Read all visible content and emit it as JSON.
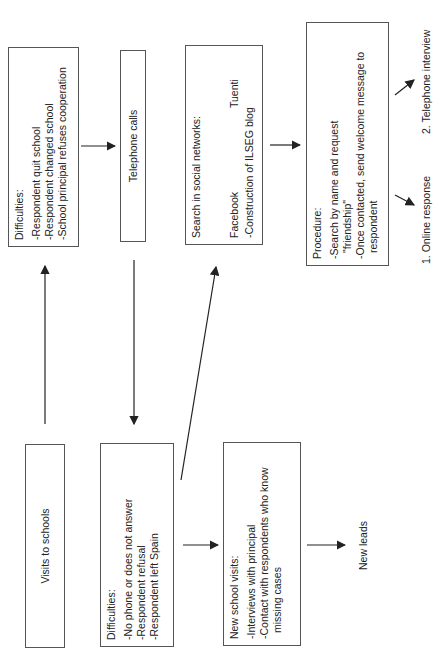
{
  "diagram": {
    "orientation": "rotated-90-ccw",
    "nodes": {
      "visits_to_schools": {
        "label": "Visits to schools"
      },
      "difficulties_schools": {
        "title": "Difficulties:",
        "items": [
          "-Respondent quit school",
          "-Respondent changed school",
          "-School principal refuses cooperation"
        ]
      },
      "telephone_calls": {
        "label": "Telephone calls"
      },
      "difficulties_phone": {
        "title": "Difficulties:",
        "items": [
          "-No phone or does not answer",
          "-Respondent refusal",
          "-Respondent left Spain"
        ]
      },
      "social_networks": {
        "title": "Search in social networks:",
        "facebook": "Facebook",
        "tuenti": "Tuenti",
        "blog": "-Construction of ILSEG blog"
      },
      "new_school_visits": {
        "title": "New school visits:",
        "items": [
          "-Interviews with principal",
          "-Contact with respondents who know",
          "missing cases"
        ]
      },
      "new_leads": {
        "label": "New leads"
      },
      "procedure": {
        "title": "Procedure:",
        "items": [
          "-Search by name and request",
          "\"friendship\"",
          "-Once contacted, send welcome message to",
          "respondent"
        ]
      },
      "online_response": {
        "label": "1. Online response"
      },
      "telephone_interview": {
        "label": "2. Telephone interview"
      }
    },
    "edges": [
      {
        "from": "visits_to_schools",
        "to": "difficulties_schools"
      },
      {
        "from": "difficulties_schools",
        "to": "telephone_calls"
      },
      {
        "from": "telephone_calls",
        "to": "difficulties_phone"
      },
      {
        "from": "difficulties_phone",
        "to": "social_networks"
      },
      {
        "from": "difficulties_phone",
        "to": "new_school_visits"
      },
      {
        "from": "new_school_visits",
        "to": "new_leads"
      },
      {
        "from": "social_networks",
        "to": "procedure"
      },
      {
        "from": "procedure",
        "to": "online_response"
      },
      {
        "from": "procedure",
        "to": "telephone_interview"
      }
    ],
    "colors": {
      "line": "#222222",
      "border": "#555555",
      "background": "#ffffff"
    }
  }
}
